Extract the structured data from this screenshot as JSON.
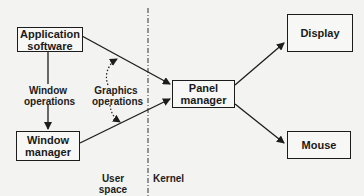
{
  "diagram": {
    "nodes": {
      "application_software": {
        "line1": "Application",
        "line2": "software"
      },
      "window_manager": {
        "line1": "Window",
        "line2": "manager"
      },
      "panel_manager": {
        "line1": "Panel",
        "line2": "manager"
      },
      "display": {
        "label": "Display"
      },
      "mouse": {
        "label": "Mouse"
      }
    },
    "edge_labels": {
      "window_operations": {
        "line1": "Window",
        "line2": "operations"
      },
      "graphics_operations": {
        "line1": "Graphics",
        "line2": "operations"
      }
    },
    "regions": {
      "user_space": "User space",
      "kernel": "Kernel"
    },
    "edges": [
      {
        "from": "Application software",
        "to": "Window manager",
        "style": "solid"
      },
      {
        "from": "Application software",
        "to": "Panel manager",
        "style": "solid"
      },
      {
        "from": "Window manager",
        "to": "Panel manager",
        "style": "solid"
      },
      {
        "from": "Window manager",
        "to": "Application software",
        "style": "dotted-curve"
      },
      {
        "from": "Panel manager",
        "to": "Display",
        "style": "solid"
      },
      {
        "from": "Panel manager",
        "to": "Mouse",
        "style": "solid"
      }
    ],
    "colors": {
      "ink": "#1c1c1c",
      "paper": "#f3f3f1"
    }
  }
}
